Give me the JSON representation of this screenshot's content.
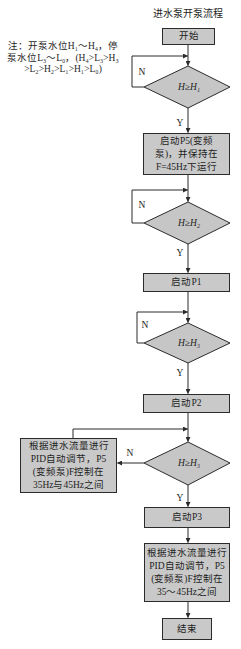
{
  "title": "进水泵开泵流程",
  "note": {
    "lines": [
      "注：开泵水位H₁～H₄，停",
      "泵水位L₃～L₀，(H₄>L₃>H₃",
      ">L₂>H₂>L₁>H₁>L₀)"
    ]
  },
  "nodes": {
    "start": "开始",
    "decision1": "H≥H₁",
    "step1": [
      "启动P5(变频",
      "泵)，并保持在",
      "F=45Hz下运行"
    ],
    "decision2": "H≥H₂",
    "step2": "启动P1",
    "decision3": "H≥H₃",
    "step3": "启动P2",
    "decision4": "H≥H₃",
    "side_step": [
      "根据进水流量进行",
      "PID自动调节，P5",
      "(变频泵)F控制在",
      "35Hz与45Hz之间"
    ],
    "step4": "启动P3",
    "step5": [
      "根据进水流量进行",
      "PID自动调节，P5",
      "(变频泵)F控制在",
      "35～45Hz之间"
    ],
    "end": "结束"
  },
  "labels": {
    "yes": "Y",
    "no": "N"
  },
  "edges": [
    {
      "from": "start",
      "to": "decision1"
    },
    {
      "from": "decision1",
      "to": "decision1",
      "label": "N"
    },
    {
      "from": "decision1",
      "to": "step1",
      "label": "Y"
    },
    {
      "from": "step1",
      "to": "decision2"
    },
    {
      "from": "decision2",
      "to": "decision2",
      "label": "N"
    },
    {
      "from": "decision2",
      "to": "step2",
      "label": "Y"
    },
    {
      "from": "step2",
      "to": "decision3"
    },
    {
      "from": "decision3",
      "to": "decision3",
      "label": "N"
    },
    {
      "from": "decision3",
      "to": "step3",
      "label": "Y"
    },
    {
      "from": "step3",
      "to": "decision4"
    },
    {
      "from": "decision4",
      "to": "side_step",
      "label": "N"
    },
    {
      "from": "side_step",
      "to": "decision4"
    },
    {
      "from": "decision4",
      "to": "step4",
      "label": "Y"
    },
    {
      "from": "step4",
      "to": "step5"
    },
    {
      "from": "step5",
      "to": "end"
    }
  ],
  "colors": {
    "box_fill": "#c9c9c9",
    "diamond_fill": "#c6c6c6",
    "stroke": "#2b2b2b",
    "text": "#1e1e1e"
  }
}
